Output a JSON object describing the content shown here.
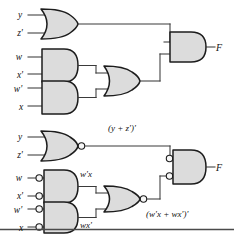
{
  "figure": {
    "background_color": "#ffffff",
    "gate_fill_color": "#dcdcdc",
    "gate_outline_color": "#1c1c1c",
    "wire_color": "#3a3a3a"
  },
  "diagrams": [
    {
      "id": "upper",
      "name": "and-or-circuit",
      "inputs": [
        {
          "label": "y",
          "x": 20,
          "y": 18
        },
        {
          "label": "z'",
          "x": 20,
          "y": 36
        },
        {
          "label": "w",
          "x": 19,
          "y": 60
        },
        {
          "label": "x'",
          "x": 20,
          "y": 78
        },
        {
          "label": "w'",
          "x": 18,
          "y": 90
        },
        {
          "label": "x",
          "x": 21,
          "y": 109
        }
      ],
      "gates": [
        {
          "name": "or-gate-yz",
          "type": "OR",
          "inputs": [
            "y",
            "z'"
          ]
        },
        {
          "name": "and-gate-wx-prime",
          "type": "AND",
          "inputs": [
            "w",
            "x'"
          ]
        },
        {
          "name": "and-gate-w-prime-x",
          "type": "AND",
          "inputs": [
            "w'",
            "x"
          ]
        },
        {
          "name": "or-gate-middle",
          "type": "OR",
          "inputs": [
            "w x'",
            "w' x"
          ]
        },
        {
          "name": "and-gate-output",
          "type": "AND",
          "inputs": [
            "y + z'",
            "w x' + w' x"
          ]
        }
      ],
      "output": {
        "label": "F",
        "x": 218,
        "y": 50
      }
    },
    {
      "id": "lower",
      "name": "nor-nand-circuit",
      "inputs": [
        {
          "label": "y",
          "x": 20,
          "y": 140
        },
        {
          "label": "z'",
          "x": 20,
          "y": 158
        },
        {
          "label": "w",
          "x": 19,
          "y": 181
        },
        {
          "label": "x'",
          "x": 20,
          "y": 199
        },
        {
          "label": "w'",
          "x": 18,
          "y": 212
        },
        {
          "label": "x",
          "x": 21,
          "y": 230
        }
      ],
      "gates": [
        {
          "name": "nor-gate-yz",
          "type": "NOR",
          "inputs": [
            "y",
            "z'"
          ]
        },
        {
          "name": "and-gate-inverted-inputs-top",
          "type": "AND-INV-INPUTS",
          "inputs": [
            "w",
            "x'"
          ]
        },
        {
          "name": "and-gate-inverted-inputs-bottom",
          "type": "AND-INV-INPUTS",
          "inputs": [
            "w'",
            "x"
          ]
        },
        {
          "name": "nor-gate-middle",
          "type": "NOR",
          "inputs": [
            "w' x",
            "w x'"
          ]
        },
        {
          "name": "and-gate-inverted-inputs-output",
          "type": "AND-INV-INPUTS",
          "inputs": [
            "(y + z')'",
            "(w' x + w x')'"
          ]
        }
      ],
      "annotations": [
        {
          "name": "annotation-nor-top",
          "text": "(y + z')'",
          "x": 108,
          "y": 131
        },
        {
          "name": "annotation-w-prime-x",
          "text": "w'x",
          "x": 80,
          "y": 177
        },
        {
          "name": "annotation-wx-prime",
          "text": "wx'",
          "x": 80,
          "y": 228
        },
        {
          "name": "annotation-nor-middle",
          "text": "(w'x + wx')'",
          "x": 146,
          "y": 216
        }
      ],
      "output": {
        "label": "F",
        "x": 218,
        "y": 172
      }
    }
  ],
  "separator": {
    "name": "page-rule",
    "y": 229
  }
}
